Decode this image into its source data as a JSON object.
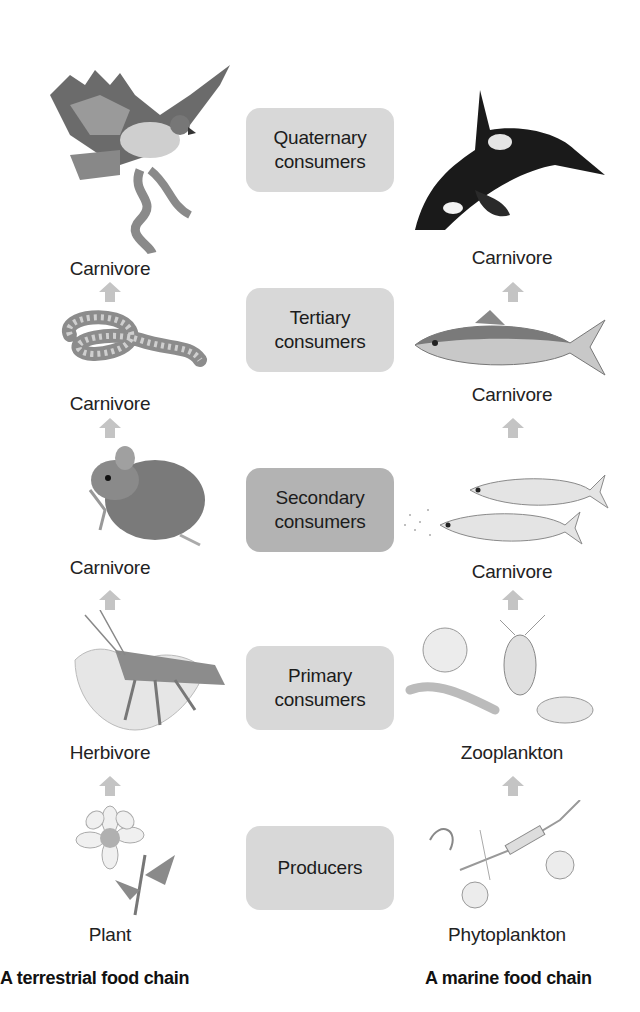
{
  "levels": [
    {
      "label_line1": "Quaternary",
      "label_line2": "consumers",
      "shade": "light"
    },
    {
      "label_line1": "Tertiary",
      "label_line2": "consumers",
      "shade": "light"
    },
    {
      "label_line1": "Secondary",
      "label_line2": "consumers",
      "shade": "dark"
    },
    {
      "label_line1": "Primary",
      "label_line2": "consumers",
      "shade": "light"
    },
    {
      "label_line1": "Producers",
      "label_line2": "",
      "shade": "light"
    }
  ],
  "terrestrial": {
    "title": "A terrestrial food chain",
    "organisms": [
      {
        "name": "hawk",
        "role": "Carnivore"
      },
      {
        "name": "rattlesnake",
        "role": "Carnivore"
      },
      {
        "name": "mouse",
        "role": "Carnivore"
      },
      {
        "name": "grasshopper",
        "role": "Herbivore"
      },
      {
        "name": "flower",
        "role": "Plant"
      }
    ]
  },
  "marine": {
    "title": "A marine food chain",
    "organisms": [
      {
        "name": "orca",
        "role": "Carnivore"
      },
      {
        "name": "tuna",
        "role": "Carnivore"
      },
      {
        "name": "small-fish",
        "role": "Carnivore"
      },
      {
        "name": "zooplankton",
        "role": "Zooplankton"
      },
      {
        "name": "phytoplankton",
        "role": "Phytoplankton"
      }
    ]
  },
  "colors": {
    "box_light": "#d8d8d8",
    "box_dark": "#b3b3b3",
    "arrow": "#c4c4c4"
  }
}
